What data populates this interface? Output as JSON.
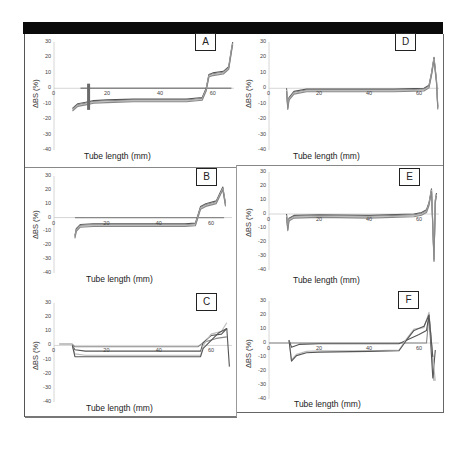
{
  "figure": {
    "type": "multi-panel line chart",
    "panels_order": [
      "A",
      "B",
      "C",
      "D",
      "E",
      "F"
    ]
  },
  "axes": {
    "ylabel": "ΔBS (%)",
    "xlabel": "Tube length (mm)",
    "yticks": [
      "30",
      "20",
      "10",
      "0",
      "-10",
      "-20",
      "-30",
      "-40"
    ],
    "xticks": [
      "0",
      "20",
      "40",
      "60"
    ]
  },
  "panels": [
    {
      "id": "A",
      "label": "A",
      "xlabel": "Tube length (mm)",
      "ylabel": "ΔBS (%)"
    },
    {
      "id": "B",
      "label": "B",
      "xlabel": "Tube length (mm)",
      "ylabel": "ΔBS (%)"
    },
    {
      "id": "C",
      "label": "C",
      "xlabel": "Tube length (mm)",
      "ylabel": "ΔBS (%)"
    },
    {
      "id": "D",
      "label": "D",
      "xlabel": "Tube length (mm)",
      "ylabel": "ΔBS (%)"
    },
    {
      "id": "E",
      "label": "E",
      "xlabel": "Tube length (mm)",
      "ylabel": "ΔBS (%)"
    },
    {
      "id": "F",
      "label": "F",
      "xlabel": "Tube length (mm)",
      "ylabel": "ΔBS (%)"
    }
  ],
  "colors": {
    "frame": "#555555",
    "topbar": "#0a0a0a",
    "curve_dark": "#555555",
    "curve_mid": "#888888",
    "curve_light": "#bbbbbb",
    "axis": "#cccccc"
  },
  "chart_data": [
    {
      "panel": "A",
      "type": "line",
      "title": "A",
      "xlabel": "Tube length (mm)",
      "ylabel": "ΔBS (%)",
      "xlim": [
        0,
        68
      ],
      "ylim": [
        -40,
        30
      ],
      "xticks": [
        0,
        20,
        40,
        60
      ],
      "yticks": [
        30,
        20,
        10,
        0,
        -10,
        -20,
        -30,
        -40
      ],
      "grid": false,
      "legend": null,
      "series": [
        {
          "name": "reference (t0)",
          "x": [
            10,
            67
          ],
          "y": [
            0,
            0
          ]
        },
        {
          "name": "scans (overlaid)",
          "x": [
            7,
            9,
            12,
            15,
            20,
            30,
            40,
            50,
            56,
            57.5,
            58.5,
            60,
            64,
            66,
            67,
            67.5
          ],
          "y": [
            -13,
            -10,
            -9,
            -8,
            -7.5,
            -7,
            -7,
            -7,
            -6,
            0,
            9,
            10,
            11,
            14,
            25,
            30
          ]
        }
      ],
      "annotations": [
        "dark vertical marker near x=13 spanning approx 3 to -14"
      ]
    },
    {
      "panel": "B",
      "type": "line",
      "title": "B",
      "xlabel": "Tube length (mm)",
      "ylabel": "ΔBS (%)",
      "xlim": [
        0,
        68
      ],
      "ylim": [
        -40,
        30
      ],
      "xticks": [
        0,
        20,
        40,
        60
      ],
      "yticks": [
        30,
        20,
        10,
        0,
        -10,
        -20,
        -30,
        -40
      ],
      "grid": false,
      "legend": null,
      "series": [
        {
          "name": "reference (t0)",
          "x": [
            8,
            65
          ],
          "y": [
            0,
            0
          ]
        },
        {
          "name": "scans (overlaid)",
          "x": [
            8,
            8.5,
            10,
            15,
            20,
            30,
            40,
            50,
            54,
            55,
            56,
            58,
            62,
            64.5,
            65.5
          ],
          "y": [
            -13,
            -8,
            -5,
            -4.5,
            -4.5,
            -4.5,
            -4.5,
            -4.5,
            -4,
            2,
            8,
            10,
            12,
            22,
            10
          ]
        }
      ]
    },
    {
      "panel": "C",
      "type": "line",
      "title": "C",
      "xlabel": "Tube length (mm)",
      "ylabel": "ΔBS (%)",
      "xlim": [
        0,
        68
      ],
      "ylim": [
        -40,
        30
      ],
      "xticks": [
        0,
        20,
        40,
        60
      ],
      "yticks": [
        30,
        20,
        10,
        0,
        -10,
        -20,
        -30,
        -40
      ],
      "grid": false,
      "legend": null,
      "series": [
        {
          "name": "scan early",
          "x": [
            2,
            7,
            8,
            55,
            57,
            62,
            66
          ],
          "y": [
            1,
            1,
            -1,
            -1,
            2,
            5,
            6
          ]
        },
        {
          "name": "scan mid",
          "x": [
            7,
            8,
            12,
            20,
            56,
            57,
            60,
            64,
            66
          ],
          "y": [
            0,
            -3,
            -4,
            -4,
            -4,
            2,
            7,
            8,
            12
          ]
        },
        {
          "name": "scan late",
          "x": [
            7,
            8,
            12,
            20,
            56,
            57,
            60,
            64,
            66
          ],
          "y": [
            0,
            -6,
            -7,
            -7,
            -7,
            0,
            8,
            10,
            16
          ]
        },
        {
          "name": "scan last",
          "x": [
            7,
            8,
            15,
            56,
            57,
            63,
            66,
            67
          ],
          "y": [
            0,
            -8,
            -8,
            -8,
            -2,
            9,
            12,
            -15
          ]
        }
      ]
    },
    {
      "panel": "D",
      "type": "line",
      "title": "D",
      "xlabel": "Tube length (mm)",
      "ylabel": "ΔBS (%)",
      "xlim": [
        0,
        68
      ],
      "ylim": [
        -40,
        30
      ],
      "xticks": [
        0,
        20,
        40,
        60
      ],
      "yticks": [
        30,
        20,
        10,
        0,
        -10,
        -20,
        -30,
        -40
      ],
      "grid": false,
      "legend": null,
      "series": [
        {
          "name": "scans (overlaid)",
          "x": [
            7,
            7.5,
            8,
            10,
            15,
            30,
            50,
            62,
            64,
            65,
            66,
            67,
            67.5
          ],
          "y": [
            0,
            -12,
            -6,
            -2,
            -0.5,
            -0.5,
            -0.5,
            0,
            2,
            10,
            20,
            5,
            -12
          ]
        }
      ]
    },
    {
      "panel": "E",
      "type": "line",
      "title": "E",
      "xlabel": "Tube length (mm)",
      "ylabel": "ΔBS (%)",
      "xlim": [
        0,
        68
      ],
      "ylim": [
        -40,
        30
      ],
      "xticks": [
        0,
        20,
        40,
        60
      ],
      "yticks": [
        30,
        20,
        10,
        0,
        -10,
        -20,
        -30,
        -40
      ],
      "grid": false,
      "legend": null,
      "series": [
        {
          "name": "scans (overlaid)",
          "x": [
            7,
            7.5,
            8,
            10,
            20,
            40,
            58,
            61,
            63,
            64,
            65,
            66,
            66.5,
            67
          ],
          "y": [
            0,
            -10,
            -3,
            -1,
            -0.5,
            -1,
            0,
            1,
            3,
            8,
            18,
            -32,
            10,
            15
          ]
        }
      ]
    },
    {
      "panel": "F",
      "type": "line",
      "title": "F",
      "xlabel": "Tube length (mm)",
      "ylabel": "ΔBS (%)",
      "xlim": [
        0,
        68
      ],
      "ylim": [
        -40,
        30
      ],
      "xticks": [
        0,
        20,
        40,
        60
      ],
      "yticks": [
        30,
        20,
        10,
        0,
        -10,
        -20,
        -30,
        -40
      ],
      "grid": false,
      "legend": null,
      "series": [
        {
          "name": "reference",
          "x": [
            0,
            60,
            63,
            64,
            65,
            66
          ],
          "y": [
            0,
            0,
            0,
            20,
            0,
            -27
          ]
        },
        {
          "name": "scan 1",
          "x": [
            8,
            9,
            12,
            20,
            40,
            52,
            55,
            60,
            63,
            64,
            65.5,
            66.5
          ],
          "y": [
            2,
            -3,
            -1,
            -0.5,
            -0.5,
            -0.5,
            2,
            6,
            9,
            20,
            -25,
            -5
          ]
        },
        {
          "name": "scan 2",
          "x": [
            8,
            9,
            11,
            15,
            20,
            40,
            52,
            55,
            58,
            62,
            64,
            65,
            66.5
          ],
          "y": [
            2,
            -12,
            -8,
            -6,
            -5.5,
            -5.5,
            -5,
            3,
            10,
            11,
            22,
            0,
            -27
          ]
        },
        {
          "name": "scan 3",
          "x": [
            8,
            9,
            11,
            15,
            20,
            40,
            52,
            55,
            58,
            62,
            64,
            65.5
          ],
          "y": [
            2,
            -13,
            -9,
            -7,
            -6.5,
            -6,
            -5.5,
            2,
            9,
            12,
            20,
            -10
          ]
        }
      ]
    }
  ]
}
